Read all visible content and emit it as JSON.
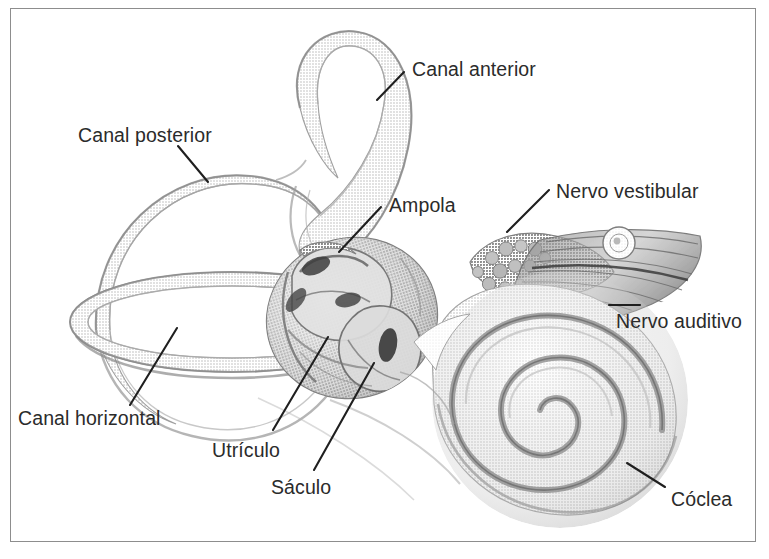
{
  "figure": {
    "style": "halftone pencil illustration",
    "border_color": "#8d8d8d",
    "background_color": "#ffffff",
    "ink_color": "#2b2b2b",
    "structure_tone": "#9a9a9a"
  },
  "labels": [
    {
      "id": "canal-anterior",
      "text": "Canal anterior",
      "x": 412,
      "y": 60,
      "anchor": "start"
    },
    {
      "id": "canal-posterior",
      "text": "Canal posterior",
      "x": 78,
      "y": 126,
      "anchor": "start"
    },
    {
      "id": "nervo-vestibular",
      "text": "Nervo vestibular",
      "x": 556,
      "y": 182,
      "anchor": "start"
    },
    {
      "id": "ampola",
      "text": "Ampola",
      "x": 389,
      "y": 196,
      "anchor": "start"
    },
    {
      "id": "nervo-auditivo",
      "text": "Nervo auditivo",
      "x": 616,
      "y": 312,
      "anchor": "start"
    },
    {
      "id": "canal-horizontal",
      "text": "Canal horizontal",
      "x": 18,
      "y": 409,
      "anchor": "start"
    },
    {
      "id": "utriculo",
      "text": "Utrículo",
      "x": 212,
      "y": 441,
      "anchor": "start"
    },
    {
      "id": "saculo",
      "text": "Sáculo",
      "x": 271,
      "y": 478,
      "anchor": "start"
    },
    {
      "id": "coclea",
      "text": "Cóclea",
      "x": 671,
      "y": 490,
      "anchor": "start"
    }
  ],
  "leader_lines": [
    {
      "id": "leader-canal-anterior",
      "x1": 404,
      "y1": 72,
      "x2": 377,
      "y2": 100
    },
    {
      "id": "leader-canal-posterior",
      "x1": 178,
      "y1": 146,
      "x2": 208,
      "y2": 182
    },
    {
      "id": "leader-nervo-vestibular",
      "x1": 549,
      "y1": 190,
      "x2": 507,
      "y2": 232
    },
    {
      "id": "leader-ampola",
      "x1": 381,
      "y1": 207,
      "x2": 339,
      "y2": 252
    },
    {
      "id": "leader-nervo-auditivo",
      "x1": 609,
      "y1": 305,
      "x2": 640,
      "y2": 305
    },
    {
      "id": "leader-canal-horizontal",
      "x1": 130,
      "y1": 405,
      "x2": 177,
      "y2": 328
    },
    {
      "id": "leader-utriculo",
      "x1": 273,
      "y1": 430,
      "x2": 328,
      "y2": 337
    },
    {
      "id": "leader-saculo",
      "x1": 314,
      "y1": 470,
      "x2": 374,
      "y2": 363
    },
    {
      "id": "leader-coclea",
      "x1": 665,
      "y1": 487,
      "x2": 627,
      "y2": 463
    }
  ],
  "anatomy_parts": [
    {
      "id": "canal-anterior-loop",
      "name": "Canal semicircular anterior"
    },
    {
      "id": "canal-posterior-loop",
      "name": "Canal semicircular posterior"
    },
    {
      "id": "canal-horizontal-loop",
      "name": "Canal semicircular horizontal"
    },
    {
      "id": "vestibule-body",
      "name": "Vestíbulo com utrículo e sáculo"
    },
    {
      "id": "ampulla-swelling",
      "name": "Ampola"
    },
    {
      "id": "vestibular-nerve",
      "name": "Nervo vestibular"
    },
    {
      "id": "auditory-nerve",
      "name": "Nervo auditivo"
    },
    {
      "id": "cochlea-spiral",
      "name": "Cóclea"
    }
  ]
}
